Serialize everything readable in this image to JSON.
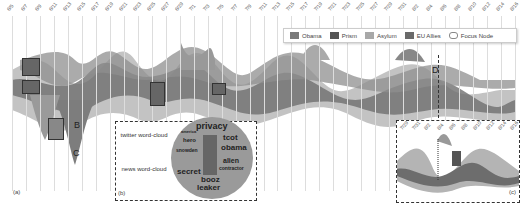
{
  "figure": {
    "dates": [
      "6/5",
      "6/7",
      "6/9",
      "6/11",
      "6/13",
      "6/15",
      "6/17",
      "6/19",
      "6/21",
      "6/23",
      "6/25",
      "6/27",
      "6/29",
      "7/1",
      "7/3",
      "7/5",
      "7/7",
      "7/9",
      "7/11",
      "7/13",
      "7/15",
      "7/17",
      "7/19",
      "7/21",
      "7/23",
      "7/25",
      "7/27",
      "7/29",
      "7/31",
      "8/2",
      "8/4",
      "8/6",
      "8/8",
      "8/10",
      "8/12",
      "8/14",
      "8/16"
    ],
    "inset_dates": [
      "7/29",
      "7/31",
      "8/2",
      "8/4",
      "8/6",
      "8/8",
      "8/10",
      "8/12",
      "8/14",
      "8/16"
    ],
    "legend": {
      "items": [
        {
          "label": "Obama",
          "color": "#7a7a7a"
        },
        {
          "label": "Prism",
          "color": "#555555"
        },
        {
          "label": "Asylum",
          "color": "#a8a8a8"
        },
        {
          "label": "EU Allies",
          "color": "#6a6a6a"
        },
        {
          "label": "Focus Node",
          "color": "#ffffff"
        }
      ]
    },
    "panels": {
      "a": "(a)",
      "b": "(b)",
      "c": "(c)"
    },
    "letters": [
      "B",
      "C",
      "D",
      "E",
      "F"
    ],
    "cloud": {
      "twitter_label": "twitter word-cloud",
      "news_label": "news word-cloud",
      "words": [
        "privacy",
        "tcot",
        "obama",
        "alien",
        "booz",
        "leaker",
        "secret",
        "hero",
        "snowden",
        "america",
        "contractor",
        "hong",
        "kong"
      ]
    },
    "annotations": {
      "asylum_vertical": "asylum",
      "inset_vertical": "snowden"
    }
  }
}
